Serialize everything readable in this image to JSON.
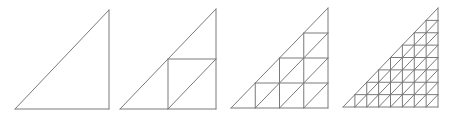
{
  "diagram": {
    "stroke_color": "#7a7a7a",
    "background": "#ffffff",
    "triangles": [
      {
        "name": "level-0",
        "subdivisions": 1,
        "x0": 15,
        "y0": 109,
        "x1": 109,
        "y1": 10
      },
      {
        "name": "level-1",
        "subdivisions": 2,
        "x0": 120,
        "y0": 109,
        "x1": 216,
        "y1": 9
      },
      {
        "name": "level-2",
        "subdivisions": 4,
        "x0": 231,
        "y0": 108,
        "x1": 328,
        "y1": 8
      },
      {
        "name": "level-3",
        "subdivisions": 8,
        "x0": 343,
        "y0": 107,
        "x1": 438,
        "y1": 8
      }
    ]
  }
}
